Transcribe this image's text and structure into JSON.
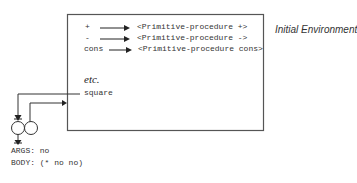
{
  "environment": {
    "title": "Initial Environment",
    "bindings": [
      {
        "name": "+",
        "value": "<Primitive-procedure +>"
      },
      {
        "name": "-",
        "value": "<Primitive-procedure ->"
      },
      {
        "name": "cons",
        "value": "<Primitive-procedure cons>"
      }
    ],
    "etc_label": "etc.",
    "new_binding": {
      "name": "square"
    }
  },
  "procedure_object": {
    "args_label": "ARGS: no",
    "body_label": "BODY: (* no no)"
  },
  "colors": {
    "line": "#444444",
    "box_border": "#555555",
    "text": "#333333"
  }
}
